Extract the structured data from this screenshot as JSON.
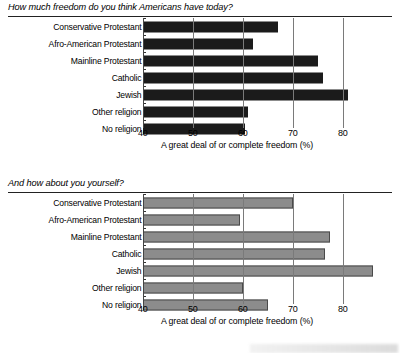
{
  "chart_data": [
    {
      "type": "bar",
      "orientation": "horizontal",
      "title": "How much freedom do you think Americans have today?",
      "xlabel": "A great deal of or complete freedom (%)",
      "ylabel": "",
      "categories": [
        "Conservative Protestant",
        "Afro-American Protestant",
        "Mainline Protestant",
        "Catholic",
        "Jewish",
        "Other religion",
        "No religion"
      ],
      "values": [
        67,
        62,
        75,
        76,
        81,
        61,
        60.5
      ],
      "xlim": [
        40,
        85
      ],
      "xticks": [
        40,
        50,
        60,
        70,
        80
      ],
      "xticklabels": [
        "40",
        "50",
        "60",
        "70",
        "80"
      ],
      "grid": true,
      "legend": "none",
      "bar_color": "#1b1b1b"
    },
    {
      "type": "bar",
      "orientation": "horizontal",
      "title": "And how about you yourself?",
      "xlabel": "A great deal of or complete freedom (%)",
      "ylabel": "",
      "categories": [
        "Conservative Protestant",
        "Afro-American Protestant",
        "Mainline Protestant",
        "Catholic",
        "Jewish",
        "Other religion",
        "No religion"
      ],
      "values": [
        70,
        59.5,
        77.5,
        76.5,
        86,
        60,
        65
      ],
      "xlim": [
        40,
        90
      ],
      "xticks": [
        40,
        50,
        60,
        70,
        80
      ],
      "xticklabels": [
        "40",
        "50",
        "60",
        "70",
        "80"
      ],
      "grid": true,
      "legend": "none",
      "bar_color": "#8c8c8c"
    }
  ],
  "panels": {
    "top": {
      "title": "How much freedom do you think Americans have today?",
      "xtitle": "A great deal of or complete freedom (%)",
      "ticks": [
        "40",
        "50",
        "60",
        "70",
        "80"
      ],
      "rows": [
        {
          "label": "Conservative Protestant",
          "value": 67
        },
        {
          "label": "Afro-American Protestant",
          "value": 62
        },
        {
          "label": "Mainline Protestant",
          "value": 75
        },
        {
          "label": "Catholic",
          "value": 76
        },
        {
          "label": "Jewish",
          "value": 81
        },
        {
          "label": "Other religion",
          "value": 61
        },
        {
          "label": "No religion",
          "value": 60.5
        }
      ]
    },
    "bottom": {
      "title": "And how about you yourself?",
      "xtitle": "A great deal of or complete freedom (%)",
      "ticks": [
        "40",
        "50",
        "60",
        "70",
        "80"
      ],
      "rows": [
        {
          "label": "Conservative Protestant",
          "value": 70
        },
        {
          "label": "Afro-American Protestant",
          "value": 59.5
        },
        {
          "label": "Mainline Protestant",
          "value": 77.5
        },
        {
          "label": "Catholic",
          "value": 76.5
        },
        {
          "label": "Jewish",
          "value": 86
        },
        {
          "label": "Other religion",
          "value": 60
        },
        {
          "label": "No religion",
          "value": 65
        }
      ]
    }
  }
}
